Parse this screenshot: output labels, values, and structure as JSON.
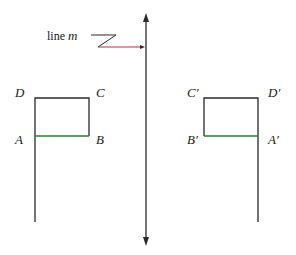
{
  "diagram": {
    "line_label": {
      "text": "line ",
      "var": "m"
    },
    "colors": {
      "stroke": "#2a2a2a",
      "segment_ab": "#2e7d32",
      "pointer": "#c62828"
    },
    "original": {
      "points": {
        "D": "D",
        "C": "C",
        "A": "A",
        "B": "B"
      }
    },
    "image": {
      "points": {
        "C": "C′",
        "D": "D′",
        "B": "B′",
        "A": "A′"
      }
    }
  }
}
